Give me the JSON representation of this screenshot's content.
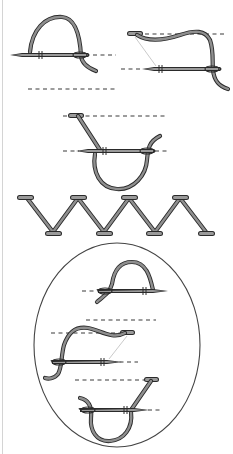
{
  "diagram": {
    "colors": {
      "outline": "#2a2a2a",
      "thread_fill": "#8f8f8f",
      "needle_fill": "#9a9a9a",
      "guide_line": "#3a3a3a",
      "background": "#ffffff"
    },
    "steps": [
      {
        "id": "step-1",
        "description": "needle enters lower line, thread loops over right"
      },
      {
        "id": "step-2",
        "description": "thread crosses to upper line, needle at lower line"
      },
      {
        "id": "step-3",
        "description": "needle at lower line with thread loop below"
      },
      {
        "id": "zigzag",
        "description": "completed herringbone zigzag row with 4 upper and 4 lower tacks"
      },
      {
        "id": "detail-circle",
        "description": "magnified detail of three stitch steps reversed"
      }
    ]
  }
}
